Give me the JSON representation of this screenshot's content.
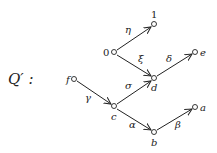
{
  "title": "Q′ :",
  "nodes": {
    "n1": {
      "label": "1"
    },
    "n0": {
      "label": "0"
    },
    "e": {
      "label": "e"
    },
    "d": {
      "label": "d"
    },
    "f": {
      "label": "f"
    },
    "c": {
      "label": "c"
    },
    "a": {
      "label": "a"
    },
    "b": {
      "label": "b"
    }
  },
  "edges": {
    "eta": {
      "label": "η",
      "from": "0",
      "to": "1"
    },
    "xi": {
      "label": "ξ",
      "from": "0",
      "to": "d"
    },
    "delta": {
      "label": "δ",
      "from": "d",
      "to": "e"
    },
    "sigma": {
      "label": "σ",
      "from": "c",
      "to": "d"
    },
    "gamma": {
      "label": "γ",
      "from": "f",
      "to": "c"
    },
    "alpha": {
      "label": "α",
      "from": "c",
      "to": "b"
    },
    "beta": {
      "label": "β",
      "from": "b",
      "to": "a"
    }
  }
}
